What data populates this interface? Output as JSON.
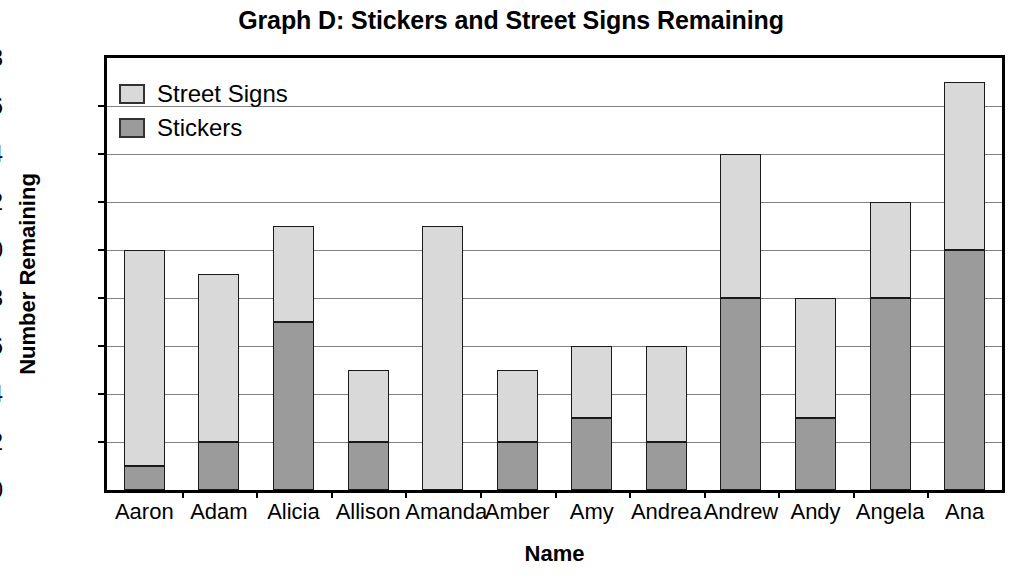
{
  "chart_data": {
    "type": "bar",
    "subtype": "stacked-bar",
    "title": "Graph D: Stickers and Street Signs Remaining",
    "xlabel": "Name",
    "ylabel": "Number Remaining",
    "ylim": [
      0,
      18
    ],
    "ytick_step": 2,
    "yticks": [
      18,
      16,
      14,
      12,
      10,
      8,
      6,
      4,
      2,
      0
    ],
    "grid": true,
    "grid_axis": "y",
    "legend_position": "top-left-inside",
    "categories": [
      "Aaron",
      "Adam",
      "Alicia",
      "Allison",
      "Amanda",
      "Amber",
      "Amy",
      "Andrea",
      "Andrew",
      "Andy",
      "Angela",
      "Ana"
    ],
    "series": [
      {
        "name": "Stickers",
        "color": "#9b9b9b",
        "values": [
          1,
          2,
          7,
          2,
          0,
          2,
          3,
          2,
          8,
          3,
          8,
          10
        ]
      },
      {
        "name": "Street Signs",
        "color": "#d9d9d9",
        "values": [
          9,
          7,
          4,
          3,
          11,
          3,
          3,
          4,
          6,
          5,
          4,
          7
        ]
      }
    ],
    "totals": [
      10,
      9,
      11,
      5,
      11,
      5,
      6,
      6,
      14,
      8,
      12,
      17
    ],
    "stack_order_bottom_to_top": [
      "Stickers",
      "Street Signs"
    ]
  },
  "legend": {
    "items": [
      {
        "label": "Street Signs",
        "color": "#d9d9d9"
      },
      {
        "label": "Stickers",
        "color": "#9b9b9b"
      }
    ]
  },
  "colors": {
    "street_signs": "#d9d9d9",
    "stickers": "#9b9b9b",
    "axis": "#000000",
    "gridline": "#808080",
    "background": "#ffffff"
  }
}
